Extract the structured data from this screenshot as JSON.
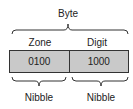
{
  "diagram": {
    "title": "Byte",
    "fields": [
      {
        "label": "Zone",
        "value": "0100",
        "group_label": "Nibble"
      },
      {
        "label": "Digit",
        "value": "1000",
        "group_label": "Nibble"
      }
    ],
    "colors": {
      "cell_fill": "#c9c9c9",
      "stroke": "#333333"
    }
  }
}
